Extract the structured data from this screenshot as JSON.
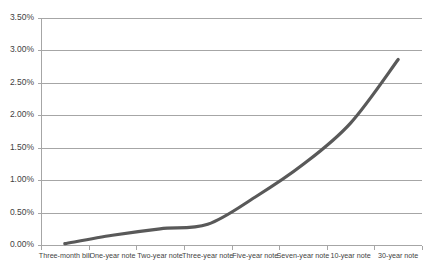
{
  "chart_data": {
    "type": "line",
    "title": "",
    "subtitle": "",
    "xlabel": "",
    "ylabel": "",
    "grid": true,
    "legend": false,
    "legend_position": "none",
    "line_color": "#595959",
    "gridline_color": "#a6a6a6",
    "background_color": "#ffffff",
    "ylim": [
      0.0,
      3.5
    ],
    "ytick_step": 0.5,
    "ytick_format": "percent-2dp",
    "yticks": [
      0.0,
      0.5,
      1.0,
      1.5,
      2.0,
      2.5,
      3.0,
      3.5
    ],
    "ytick_labels": [
      "0.00%",
      "0.50%",
      "1.00%",
      "1.50%",
      "2.00%",
      "2.50%",
      "3.00%",
      "3.50%"
    ],
    "categories": [
      "Three-month bill",
      "One-year note",
      "Two-year note",
      "Three-year note",
      "Five-year note",
      "Seven-year note",
      "10-year note",
      "30-year note"
    ],
    "values": [
      0.02,
      0.15,
      0.25,
      0.32,
      0.74,
      1.24,
      1.88,
      2.86
    ],
    "series": [
      {
        "name": "Yield",
        "values": [
          0.02,
          0.15,
          0.25,
          0.32,
          0.74,
          1.24,
          1.88,
          2.86
        ]
      }
    ],
    "annotations": []
  }
}
